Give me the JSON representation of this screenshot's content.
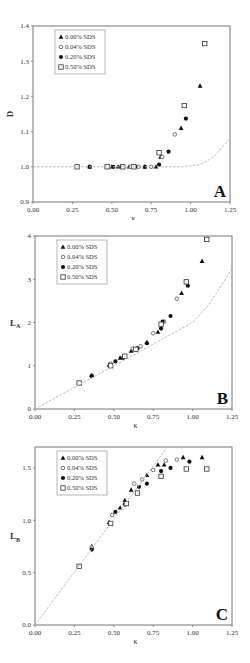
{
  "figure": {
    "legend_labels": [
      "0.00% SDS",
      "0.04% SDS",
      "0.20% SDS",
      "0.50% SDS"
    ],
    "marker_styles": [
      "filled-triangle",
      "open-diamond",
      "filled-circle",
      "open-square"
    ]
  },
  "chart_data": [
    {
      "id": "A",
      "type": "scatter",
      "panel_label": "A",
      "title": "",
      "xlabel": "κ",
      "ylabel": "D",
      "xlim": [
        0.0,
        1.25
      ],
      "ylim": [
        0.9,
        1.4
      ],
      "xticks": [
        "0.00",
        "0.25",
        "0.50",
        "0.75",
        "1.00",
        "1.25"
      ],
      "yticks": [
        "0.9",
        "1.0",
        "1.1",
        "1.2",
        "1.3",
        "1.4"
      ],
      "grid": false,
      "legend_position": "upper-left",
      "series": [
        {
          "name": "0.00% SDS",
          "marker": "triangle-filled",
          "points": [
            [
              0.36,
              1.0
            ],
            [
              0.5,
              1.0
            ],
            [
              0.54,
              1.0
            ],
            [
              0.61,
              1.0
            ],
            [
              0.71,
              1.0
            ],
            [
              0.78,
              1.0
            ],
            [
              0.81,
              1.028
            ],
            [
              0.94,
              1.11
            ],
            [
              1.06,
              1.23
            ]
          ]
        },
        {
          "name": "0.04% SDS",
          "marker": "diamond-open",
          "points": [
            [
              0.36,
              1.0
            ],
            [
              0.48,
              1.0
            ],
            [
              0.62,
              1.0
            ],
            [
              0.67,
              1.0
            ],
            [
              0.75,
              1.0
            ],
            [
              0.82,
              1.028
            ],
            [
              0.9,
              1.092
            ]
          ]
        },
        {
          "name": "0.20% SDS",
          "marker": "circle-filled",
          "points": [
            [
              0.36,
              1.0
            ],
            [
              0.51,
              1.0
            ],
            [
              0.56,
              1.0
            ],
            [
              0.65,
              1.0
            ],
            [
              0.71,
              1.0
            ],
            [
              0.8,
              1.006
            ],
            [
              0.86,
              1.043
            ],
            [
              0.97,
              1.137
            ]
          ]
        },
        {
          "name": "0.50% SDS",
          "marker": "square-open",
          "points": [
            [
              0.28,
              1.0
            ],
            [
              0.47,
              1.0
            ],
            [
              0.57,
              1.0
            ],
            [
              0.64,
              1.0
            ],
            [
              0.8,
              1.04
            ],
            [
              0.96,
              1.174
            ],
            [
              1.09,
              1.35
            ]
          ]
        },
        {
          "name": "model",
          "line": "dashed",
          "points": [
            [
              0.0,
              1.0
            ],
            [
              0.95,
              1.0
            ],
            [
              1.05,
              1.005
            ],
            [
              1.1,
              1.015
            ],
            [
              1.15,
              1.03
            ],
            [
              1.2,
              1.055
            ],
            [
              1.25,
              1.08
            ]
          ]
        }
      ]
    },
    {
      "id": "B",
      "type": "scatter",
      "panel_label": "B",
      "title": "",
      "xlabel": "κ",
      "ylabel": "LA",
      "ylabel_main": "L",
      "ylabel_sub": "A",
      "xlim": [
        0.0,
        1.25
      ],
      "ylim": [
        0,
        4
      ],
      "xticks": [
        "0.00",
        "0.25",
        "0.50",
        "0.75",
        "1.00",
        "1.25"
      ],
      "yticks": [
        "0",
        "1",
        "2",
        "3",
        "4"
      ],
      "grid": false,
      "legend_position": "upper-left",
      "series": [
        {
          "name": "0.00% SDS",
          "marker": "triangle-filled",
          "points": [
            [
              0.36,
              0.78
            ],
            [
              0.47,
              1.02
            ],
            [
              0.54,
              1.18
            ],
            [
              0.61,
              1.34
            ],
            [
              0.71,
              1.54
            ],
            [
              0.78,
              1.78
            ],
            [
              0.93,
              2.68
            ],
            [
              1.06,
              3.42
            ]
          ]
        },
        {
          "name": "0.04% SDS",
          "marker": "diamond-open",
          "points": [
            [
              0.36,
              0.77
            ],
            [
              0.48,
              1.05
            ],
            [
              0.62,
              1.4
            ],
            [
              0.67,
              1.45
            ],
            [
              0.75,
              1.75
            ],
            [
              0.82,
              2.02
            ],
            [
              0.9,
              2.55
            ]
          ]
        },
        {
          "name": "0.20% SDS",
          "marker": "circle-filled",
          "points": [
            [
              0.36,
              0.76
            ],
            [
              0.51,
              1.1
            ],
            [
              0.56,
              1.18
            ],
            [
              0.65,
              1.4
            ],
            [
              0.71,
              1.52
            ],
            [
              0.8,
              1.86
            ],
            [
              0.81,
              2.02
            ],
            [
              0.86,
              2.15
            ],
            [
              0.97,
              2.85
            ]
          ]
        },
        {
          "name": "0.50% SDS",
          "marker": "square-open",
          "points": [
            [
              0.28,
              0.6
            ],
            [
              0.48,
              1.0
            ],
            [
              0.57,
              1.22
            ],
            [
              0.64,
              1.38
            ],
            [
              0.8,
              1.96
            ],
            [
              0.96,
              2.94
            ],
            [
              1.09,
              3.92
            ]
          ]
        },
        {
          "name": "model",
          "line": "dashed",
          "points": [
            [
              0.0,
              0.0
            ],
            [
              0.25,
              0.5
            ],
            [
              0.5,
              1.0
            ],
            [
              0.75,
              1.5
            ],
            [
              1.0,
              2.0
            ],
            [
              1.1,
              2.4
            ],
            [
              1.2,
              2.95
            ],
            [
              1.25,
              3.25
            ]
          ]
        }
      ]
    },
    {
      "id": "C",
      "type": "scatter",
      "panel_label": "C",
      "title": "",
      "xlabel": "κ",
      "ylabel": "LB",
      "ylabel_main": "L",
      "ylabel_sub": "B",
      "xlim": [
        0.0,
        1.25
      ],
      "ylim": [
        0.0,
        1.7
      ],
      "xticks": [
        "0.00",
        "0.25",
        "0.50",
        "0.75",
        "1.00",
        "1.25"
      ],
      "yticks": [
        "0.0",
        "0.5",
        "1.0",
        "1.5"
      ],
      "grid": false,
      "legend_position": "upper-left",
      "series": [
        {
          "name": "0.00% SDS",
          "marker": "triangle-filled",
          "points": [
            [
              0.36,
              0.75
            ],
            [
              0.47,
              0.98
            ],
            [
              0.54,
              1.12
            ],
            [
              0.57,
              1.19
            ],
            [
              0.61,
              1.29
            ],
            [
              0.71,
              1.43
            ],
            [
              0.78,
              1.53
            ],
            [
              0.82,
              1.53
            ],
            [
              0.94,
              1.6
            ],
            [
              1.06,
              1.6
            ]
          ]
        },
        {
          "name": "0.04% SDS",
          "marker": "diamond-open",
          "points": [
            [
              0.36,
              0.74
            ],
            [
              0.49,
              1.05
            ],
            [
              0.63,
              1.35
            ],
            [
              0.68,
              1.39
            ],
            [
              0.75,
              1.48
            ],
            [
              0.83,
              1.57
            ],
            [
              0.9,
              1.58
            ]
          ]
        },
        {
          "name": "0.20% SDS",
          "marker": "circle-filled",
          "points": [
            [
              0.36,
              0.72
            ],
            [
              0.51,
              1.08
            ],
            [
              0.57,
              1.15
            ],
            [
              0.66,
              1.32
            ],
            [
              0.71,
              1.35
            ],
            [
              0.8,
              1.47
            ],
            [
              0.86,
              1.5
            ],
            [
              0.98,
              1.56
            ]
          ]
        },
        {
          "name": "0.50% SDS",
          "marker": "square-open",
          "points": [
            [
              0.28,
              0.56
            ],
            [
              0.48,
              0.97
            ],
            [
              0.58,
              1.16
            ],
            [
              0.65,
              1.26
            ],
            [
              0.8,
              1.42
            ],
            [
              0.96,
              1.49
            ],
            [
              1.09,
              1.49
            ]
          ]
        },
        {
          "name": "model",
          "line": "dashed",
          "points": [
            [
              0.0,
              0.0
            ],
            [
              0.84,
              1.7
            ]
          ]
        }
      ]
    }
  ]
}
